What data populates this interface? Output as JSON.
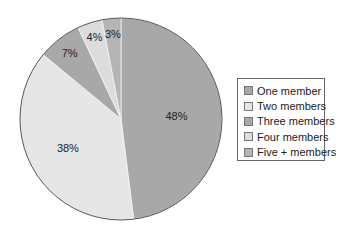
{
  "chart_data": {
    "type": "pie",
    "title": "",
    "categories": [
      "One member",
      "Two members",
      "Three members",
      "Four members",
      "Five + members"
    ],
    "values": [
      48,
      38,
      7,
      4,
      3
    ],
    "labels": [
      "48%",
      "38%",
      "7%",
      "4%",
      "3%"
    ],
    "colors": [
      "#a8a8a8",
      "#e6e6e6",
      "#a8a8a8",
      "#dcdcdc",
      "#b4b4b4"
    ],
    "legend_position": "right",
    "start_angle_deg": 0,
    "direction": "clockwise_from_top_first_slice_right"
  },
  "legend": {
    "items": [
      {
        "label": "One member",
        "color": "#a8a8a8"
      },
      {
        "label": "Two members",
        "color": "#e6e6e6"
      },
      {
        "label": "Three members",
        "color": "#a8a8a8"
      },
      {
        "label": "Four members",
        "color": "#dcdcdc"
      },
      {
        "label": "Five + members",
        "color": "#b4b4b4"
      }
    ]
  }
}
